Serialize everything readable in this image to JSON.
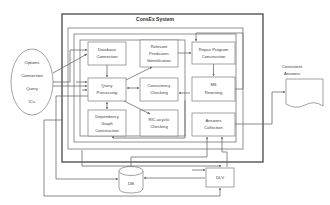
{
  "diagram": {
    "title": "ConsEx System",
    "input_node": {
      "name": "input-oval",
      "lines": [
        "Options",
        "Connection",
        "Query",
        "ICs"
      ]
    },
    "output_node": {
      "name": "consistent-answers-document",
      "label": "Consistent Answers",
      "label_lines": [
        "Consistent",
        "Answers"
      ]
    },
    "modules": [
      {
        "id": "database-connection",
        "lines": [
          "Database",
          "Connection"
        ]
      },
      {
        "id": "relevant-predicates-identification",
        "lines": [
          "Relevant",
          "Predicates",
          "Identification"
        ]
      },
      {
        "id": "repair-program-construction",
        "lines": [
          "Repair Program",
          "Construction"
        ]
      },
      {
        "id": "query-processing",
        "lines": [
          "Query",
          "Processing"
        ]
      },
      {
        "id": "consistency-checking",
        "lines": [
          "Consistency",
          "Checking"
        ]
      },
      {
        "id": "ms-rewriting",
        "lines": [
          "MS",
          "Rewriting"
        ]
      },
      {
        "id": "dependency-graph-construction",
        "lines": [
          "Dependency",
          "Graph",
          "Construction"
        ]
      },
      {
        "id": "ric-acyclic-checking",
        "lines": [
          "RIC-acyclic",
          "Checking"
        ]
      },
      {
        "id": "answers-collection",
        "lines": [
          "Answers",
          "Collection"
        ]
      }
    ],
    "stores": [
      {
        "id": "db-cylinder",
        "label": "DB"
      },
      {
        "id": "dlv-box",
        "label": "DLV"
      }
    ],
    "colors": {
      "background": "#ffffff",
      "frame_stroke": "#555555",
      "box_stroke": "#8a8a8a",
      "connector_stroke": "#6d6d6d",
      "text": "#3a3a3a"
    }
  }
}
